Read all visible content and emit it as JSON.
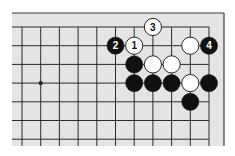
{
  "diagram": {
    "type": "go-board-fragment",
    "colors": {
      "background": "#ffffff",
      "board": "#e4e4e4",
      "line": "#2a2a2a",
      "frame": "#3a3a3a",
      "black_stone": "#111111",
      "white_stone": "#ffffff",
      "black_label": "#ffffff",
      "white_label": "#111111"
    },
    "grid": {
      "x0": 22,
      "y0": 27,
      "spacing_x": 18.7,
      "spacing_y": 18.7,
      "cols": 11,
      "rows": 7,
      "board_left": 12,
      "board_top": 13,
      "board_right": 224,
      "board_bottom": 146
    },
    "star_points": [
      {
        "col": 1,
        "row": 3
      }
    ],
    "stones": [
      {
        "color": "white",
        "col": 7,
        "row": 0,
        "label": "3"
      },
      {
        "color": "black",
        "col": 5,
        "row": 1,
        "label": "2"
      },
      {
        "color": "white",
        "col": 6,
        "row": 1,
        "label": "1"
      },
      {
        "color": "white",
        "col": 9,
        "row": 1,
        "label": ""
      },
      {
        "color": "black",
        "col": 10,
        "row": 1,
        "label": "4"
      },
      {
        "color": "black",
        "col": 6,
        "row": 2,
        "label": ""
      },
      {
        "color": "white",
        "col": 7,
        "row": 2,
        "label": ""
      },
      {
        "color": "white",
        "col": 8,
        "row": 2,
        "label": ""
      },
      {
        "color": "black",
        "col": 6,
        "row": 3,
        "label": ""
      },
      {
        "color": "black",
        "col": 7,
        "row": 3,
        "label": ""
      },
      {
        "color": "black",
        "col": 8,
        "row": 3,
        "label": ""
      },
      {
        "color": "white",
        "col": 9,
        "row": 3,
        "label": ""
      },
      {
        "color": "black",
        "col": 10,
        "row": 3,
        "label": ""
      },
      {
        "color": "black",
        "col": 9,
        "row": 4,
        "label": ""
      }
    ]
  }
}
